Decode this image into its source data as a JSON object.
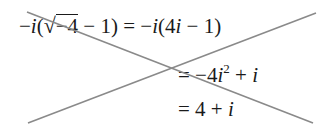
{
  "equation": {
    "line1": {
      "lhs_prefix": "−",
      "lhs_i": "i",
      "lhs_open": "(",
      "sqrt_symbol": "√",
      "radicand": "−4",
      "lhs_rest": " − 1)",
      "equals": " = ",
      "rhs_prefix": "−",
      "rhs_i": "i",
      "rhs_open": "(4",
      "rhs_i2": "i",
      "rhs_rest": " − 1)"
    },
    "line2": {
      "equals": "= ",
      "term1": "−4",
      "term1_i": "i",
      "exponent": "2",
      "plus": " + ",
      "term2_i": "i"
    },
    "line3": {
      "equals": "= ",
      "term1": "4",
      "plus": " + ",
      "term2_i": "i"
    }
  },
  "strike": {
    "color": "#8a8a8a",
    "meaning": "crossed-out"
  }
}
